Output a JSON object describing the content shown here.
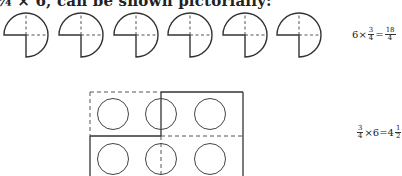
{
  "caption": {
    "text": "¾ × 6, can be shown pictorially:"
  },
  "figure1": {
    "description": "six three-quarter circles",
    "count": 6,
    "shape": "three-quarter-circle",
    "equation": {
      "lhs_whole": "6",
      "times": "×",
      "lhs_num": "3",
      "lhs_den": "4",
      "equals": "=",
      "rhs_num": "18",
      "rhs_den": "4"
    }
  },
  "figure2": {
    "description": "rectangle grid of 6 circles, 2 rows x 3 columns, divided into quarter regions",
    "rows": 2,
    "cols": 3,
    "equation": {
      "lhs_num": "3",
      "lhs_den": "4",
      "times": "×6",
      "equals": "=",
      "rhs_whole": "4",
      "rhs_num": "1",
      "rhs_den": "2"
    }
  },
  "colors": {
    "stroke": "#333333",
    "background": "#ffffff"
  }
}
